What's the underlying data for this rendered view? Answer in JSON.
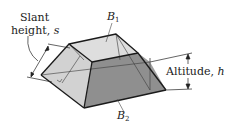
{
  "figure": {
    "labels": {
      "slant_line1": "Slant",
      "slant_line2": "height, ",
      "slant_var": "s",
      "top_base": "B",
      "top_base_sub": "1",
      "bottom_base": "B",
      "bottom_base_sub": "2",
      "altitude_text": "Altitude, ",
      "altitude_var": "h"
    },
    "colors": {
      "top_face": "#dcdcdc",
      "left_face": "#cfcfcf",
      "front_face": "#8e8e8e",
      "right_face": "#a9a9a9",
      "edge": "#1a1a1a",
      "hidden_line": "#333333"
    }
  }
}
